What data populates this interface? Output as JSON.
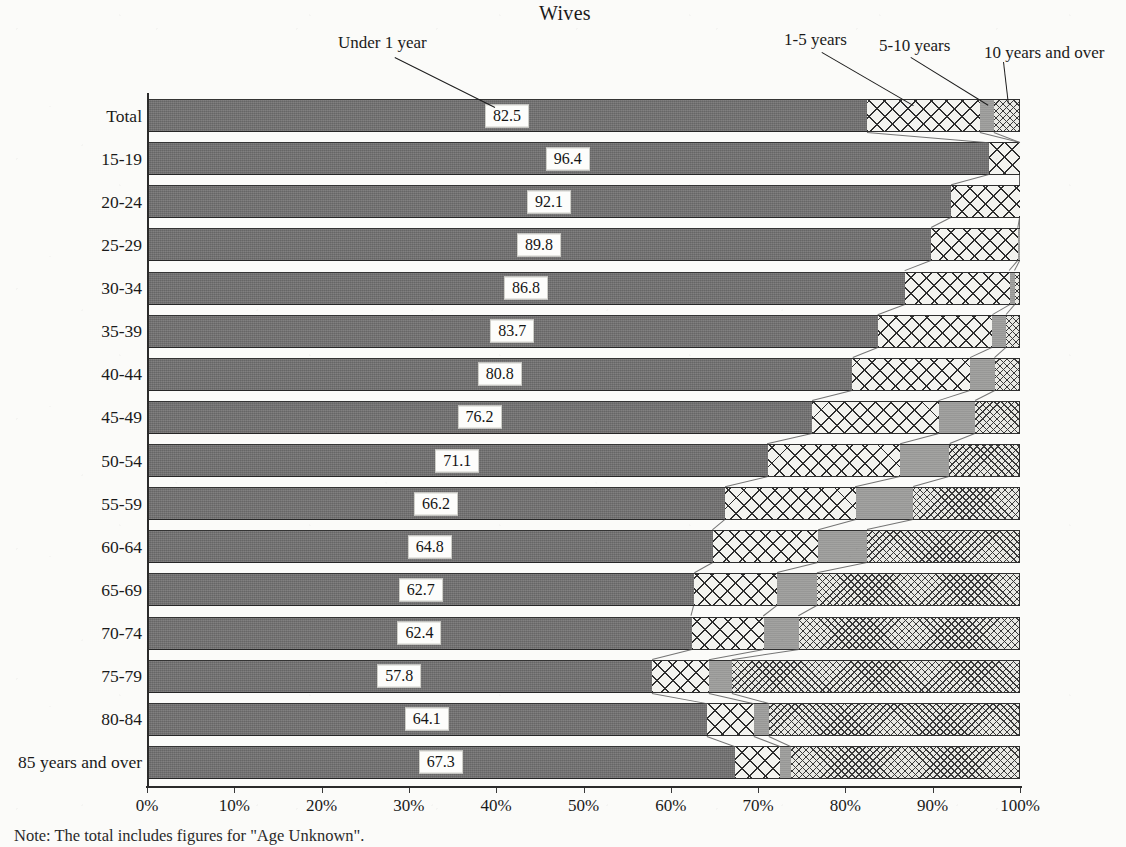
{
  "chart_data": {
    "type": "bar",
    "subtype": "horizontal-100-percent-stacked",
    "title": "Wives",
    "xlabel": "",
    "ylabel": "",
    "xlim": [
      0,
      100
    ],
    "xticks": [
      "0%",
      "10%",
      "20%",
      "30%",
      "40%",
      "50%",
      "60%",
      "70%",
      "80%",
      "90%",
      "100%"
    ],
    "grid": false,
    "legend_position": "callouts-above-plot",
    "note": "Note: The total includes figures for \"Age Unknown\".",
    "categories": [
      "Total",
      "15-19",
      "20-24",
      "25-29",
      "30-34",
      "35-39",
      "40-44",
      "45-49",
      "50-54",
      "55-59",
      "60-64",
      "65-69",
      "70-74",
      "75-79",
      "80-84",
      "85 years and over"
    ],
    "series": [
      {
        "name": "Under 1 year",
        "pattern": "solid-dark-gray",
        "color": "#706f6f",
        "labeled": true,
        "values": [
          82.5,
          96.4,
          92.1,
          89.8,
          86.8,
          83.7,
          80.8,
          76.2,
          71.1,
          66.2,
          64.8,
          62.7,
          62.4,
          57.8,
          64.1,
          67.3
        ]
      },
      {
        "name": "1-5 years",
        "pattern": "diagonal-crosshatch",
        "color": "#f3f3ef",
        "labeled": false,
        "values": [
          12.9,
          3.6,
          7.9,
          10.0,
          12.0,
          13.1,
          13.5,
          14.5,
          15.2,
          15.0,
          12.1,
          9.5,
          8.3,
          6.6,
          5.4,
          5.2
        ]
      },
      {
        "name": "5-10 years",
        "pattern": "solid-light-gray",
        "color": "#9d9d9b",
        "labeled": false,
        "values": [
          1.6,
          0.0,
          0.0,
          0.2,
          0.6,
          1.6,
          2.8,
          4.1,
          5.6,
          6.6,
          5.6,
          4.6,
          4.0,
          2.6,
          1.8,
          1.3
        ]
      },
      {
        "name": "10 years and over",
        "pattern": "fine-stipple",
        "color": "#e9e9e4",
        "labeled": false,
        "values": [
          3.0,
          0.0,
          0.0,
          0.0,
          0.6,
          1.6,
          2.9,
          5.2,
          8.1,
          12.2,
          17.5,
          23.2,
          25.3,
          33.0,
          28.7,
          26.2
        ]
      }
    ],
    "callouts": [
      {
        "label": "Under 1 year",
        "series_index": 0
      },
      {
        "label": "1-5 years",
        "series_index": 1
      },
      {
        "label": "5-10 years",
        "series_index": 2
      },
      {
        "label": "10 years and over",
        "series_index": 3
      }
    ]
  }
}
